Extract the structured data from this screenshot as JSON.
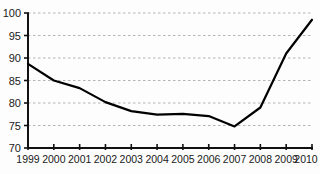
{
  "chart_data": {
    "type": "line",
    "title": "",
    "subtitle": "",
    "xlabel": "",
    "ylabel": "",
    "categories": [
      "1999",
      "2000",
      "2001",
      "2002",
      "2003",
      "2004",
      "2005",
      "2006",
      "2007",
      "2008",
      "2009",
      "2010"
    ],
    "x": [
      1999,
      2000,
      2001,
      2002,
      2003,
      2004,
      2005,
      2006,
      2007,
      2008,
      2009,
      2010
    ],
    "values": [
      88.7,
      85.0,
      83.3,
      80.2,
      78.2,
      77.4,
      77.6,
      77.1,
      74.8,
      79.0,
      91.0,
      98.5
    ],
    "series": [
      {
        "name": "series-1",
        "values": [
          88.7,
          85.0,
          83.3,
          80.2,
          78.2,
          77.4,
          77.6,
          77.1,
          74.8,
          79.0,
          91.0,
          98.5
        ],
        "color": "#000000"
      }
    ],
    "ylim": [
      70,
      100
    ],
    "xlim": [
      1999,
      2010
    ],
    "yticks": [
      70,
      75,
      80,
      85,
      90,
      95,
      100
    ],
    "ytick_labels": [
      "70",
      "75",
      "80",
      "85",
      "90",
      "95",
      "100"
    ],
    "xtick_labels": [
      "1999",
      "2000",
      "2001",
      "2002",
      "2003",
      "2004",
      "2005",
      "2006",
      "2007",
      "2008",
      "2009",
      "2010"
    ],
    "grid": true,
    "grid_axis": "y",
    "grid_style": "dashed",
    "grid_color": "#b4b4b4",
    "legend": false,
    "legend_position": "none",
    "line_color": "#000000",
    "line_width": 2.2,
    "markers": false,
    "background_color": "#fdfdfd",
    "axis_color": "#111111",
    "annotations": []
  }
}
